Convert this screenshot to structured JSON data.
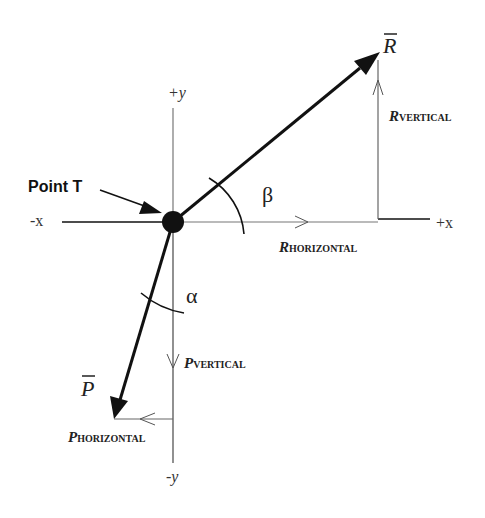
{
  "diagram": {
    "colors": {
      "ink": "#111111",
      "thin": "#555555",
      "background": "#ffffff"
    },
    "axes": {
      "pos_x": "+x",
      "neg_x": "-x",
      "pos_y": "+y",
      "neg_y": "-y"
    },
    "point": {
      "label": "Point T"
    },
    "vectors": {
      "R": {
        "symbol": "R",
        "overbar": true,
        "horizontal_label_main": "R",
        "horizontal_label_sub": "HORIZONTAL",
        "vertical_label_main": "R",
        "vertical_label_sub": "VERTICAL",
        "angle_label": "β",
        "angle_reference": "+x axis"
      },
      "P": {
        "symbol": "P",
        "overbar": true,
        "horizontal_label_main": "P",
        "horizontal_label_sub": "HORIZONTAL",
        "vertical_label_main": "P",
        "vertical_label_sub": "VERTICAL",
        "angle_label": "α",
        "angle_reference": "-y axis"
      }
    }
  }
}
